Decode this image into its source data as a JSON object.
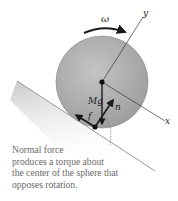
{
  "diagram": {
    "labels": {
      "omega": "ω",
      "y_axis": "y",
      "x_axis": "x",
      "weight": "Mg",
      "normal": "n",
      "friction": "f"
    },
    "caption_lines": [
      "Normal force",
      "produces a torque about",
      "the center of the sphere that",
      "opposes rotation."
    ],
    "colors": {
      "sphere": "#b5b5b5",
      "incline": "#d4d4d4",
      "arrows": "#1a1a1a",
      "caption": "#6a6a6a"
    }
  }
}
